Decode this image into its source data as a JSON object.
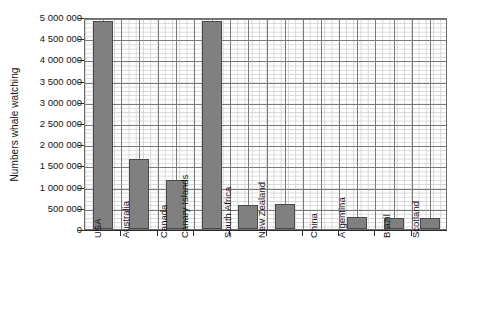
{
  "chart_data": {
    "type": "bar",
    "title": "",
    "xlabel": "",
    "ylabel": "Numbers whale watching",
    "ylim": [
      0,
      5000000
    ],
    "ytick_step": 500000,
    "grid": "major and minor gridlines, graph-paper style",
    "legend": "none",
    "bar_color": "#808080",
    "bar_edge_color": "#4a4a4a",
    "categories": [
      "USA",
      "Australia",
      "Canada",
      "Canary Islands",
      "South Africa",
      "New Zealand",
      "China",
      "Argentina",
      "Brazil",
      "Scotland"
    ],
    "values": [
      4900000,
      1650000,
      1150000,
      4900000,
      575000,
      600000,
      0,
      275000,
      250000,
      250000
    ],
    "ytick_labels": [
      "0",
      "500 000",
      "1 000 000",
      "1 500 000",
      "2 000 000",
      "2 500 000",
      "3 000 000",
      "3 500 000",
      "4 000 000",
      "4 500 000",
      "5 000 000"
    ],
    "ytick_values": [
      0,
      500000,
      1000000,
      1500000,
      2000000,
      2500000,
      3000000,
      3500000,
      4000000,
      4500000,
      5000000
    ]
  }
}
